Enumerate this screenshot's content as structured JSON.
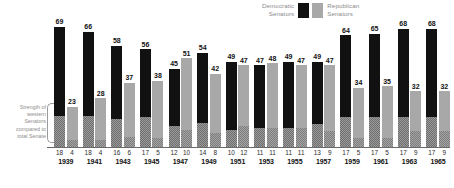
{
  "legend": {
    "democratic_label": "Democratic\nSenators",
    "republican_label": "Republican\nSenators",
    "democratic_color": "#111111",
    "republican_color": "#a8a8a8"
  },
  "side_note": {
    "text": "Strength of\nwestern\nSenators\ncompared to\ntotal Senate"
  },
  "chart_data": {
    "type": "bar",
    "title": "",
    "subtitle": "",
    "xlabel": "",
    "ylabel": "",
    "ylim": [
      0,
      70
    ],
    "grid": false,
    "legend_position": "top-right",
    "stacked_segment": "western senators (hatched lower portion of each bar)",
    "categories": [
      "1939",
      "1941",
      "1943",
      "1945",
      "1947",
      "1949",
      "1951",
      "1953",
      "1955",
      "1957",
      "1959",
      "1961",
      "1963",
      "1965"
    ],
    "series": [
      {
        "name": "Democratic Senators",
        "color": "#111111",
        "values": [
          69,
          66,
          58,
          56,
          45,
          54,
          49,
          47,
          49,
          49,
          64,
          65,
          68,
          68
        ]
      },
      {
        "name": "Republican Senators",
        "color": "#a8a8a8",
        "values": [
          23,
          28,
          37,
          38,
          51,
          42,
          47,
          48,
          47,
          47,
          34,
          35,
          32,
          32
        ]
      }
    ],
    "western_series": [
      {
        "name": "Western Democratic Senators",
        "values": [
          18,
          18,
          16,
          17,
          12,
          14,
          10,
          11,
          11,
          13,
          17,
          17,
          17,
          17
        ]
      },
      {
        "name": "Western Republican Senators",
        "values": [
          4,
          4,
          6,
          5,
          10,
          8,
          12,
          11,
          11,
          9,
          5,
          5,
          9,
          9
        ]
      }
    ],
    "groups": [
      {
        "year": "1939",
        "dem": 69,
        "rep": 23,
        "west_dem": 18,
        "west_rep": 4
      },
      {
        "year": "1941",
        "dem": 66,
        "rep": 28,
        "west_dem": 18,
        "west_rep": 4
      },
      {
        "year": "1943",
        "dem": 58,
        "rep": 37,
        "west_dem": 16,
        "west_rep": 6
      },
      {
        "year": "1945",
        "dem": 56,
        "rep": 38,
        "west_dem": 17,
        "west_rep": 5
      },
      {
        "year": "1947",
        "dem": 45,
        "rep": 51,
        "west_dem": 12,
        "west_rep": 10
      },
      {
        "year": "1949",
        "dem": 54,
        "rep": 42,
        "west_dem": 14,
        "west_rep": 8
      },
      {
        "year": "1951",
        "dem": 49,
        "rep": 47,
        "west_dem": 10,
        "west_rep": 12
      },
      {
        "year": "1953",
        "dem": 47,
        "rep": 48,
        "west_dem": 11,
        "west_rep": 11
      },
      {
        "year": "1955",
        "dem": 49,
        "rep": 47,
        "west_dem": 11,
        "west_rep": 11
      },
      {
        "year": "1957",
        "dem": 49,
        "rep": 47,
        "west_dem": 13,
        "west_rep": 9
      },
      {
        "year": "1959",
        "dem": 64,
        "rep": 34,
        "west_dem": 17,
        "west_rep": 5
      },
      {
        "year": "1961",
        "dem": 65,
        "rep": 35,
        "west_dem": 17,
        "west_rep": 5
      },
      {
        "year": "1963",
        "dem": 68,
        "rep": 32,
        "west_dem": 17,
        "west_rep": 9
      },
      {
        "year": "1965",
        "dem": 68,
        "rep": 32,
        "west_dem": 17,
        "west_rep": 9
      }
    ]
  }
}
